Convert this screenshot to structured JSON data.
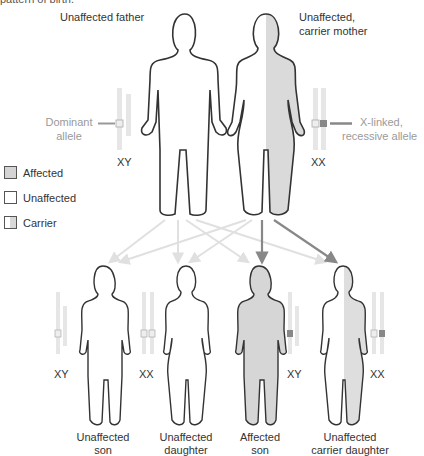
{
  "caption_fragment": "pattern of birth.",
  "parents": {
    "father": {
      "label": "Unaffected father",
      "chromosomes": "XY"
    },
    "mother": {
      "label_line1": "Unaffected,",
      "label_line2": "carrier mother",
      "chromosomes": "XX"
    }
  },
  "alleles": {
    "dominant": {
      "line1": "Dominant",
      "line2": "allele"
    },
    "recessive": {
      "line1": "X-linked,",
      "line2": "recessive allele"
    }
  },
  "legend": [
    {
      "label": "Affected",
      "color": "#d4d4d4"
    },
    {
      "label": "Unaffected",
      "color": "#ffffff"
    },
    {
      "label": "Carrier",
      "color": "#e8e8e8"
    }
  ],
  "children": [
    {
      "line1": "Unaffected",
      "line2": "son",
      "chromosomes": "XY"
    },
    {
      "line1": "Unaffected",
      "line2": "daughter",
      "chromosomes": "XX"
    },
    {
      "line1": "Affected",
      "line2": "son",
      "chromosomes": "XY"
    },
    {
      "line1": "Unaffected",
      "line2": "carrier daughter",
      "chromosomes": "XX"
    }
  ],
  "colors": {
    "outline": "#333333",
    "affected_fill": "#d4d4d4",
    "chromosome": "#e6e6e6",
    "dominant_arrow": "#e3e3e3",
    "recessive_arrow": "#8a8a8a",
    "recessive_allele": "#8c8c8c"
  }
}
